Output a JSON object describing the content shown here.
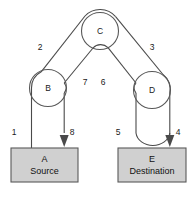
{
  "diagram": {
    "type": "pulley-system-schematic",
    "background_color": "#ffffff",
    "rope_color": "#4a4a4a",
    "block_fill_color": "#d0d0d0",
    "block_stroke_color": "#5a5a5a",
    "pulleys": [
      {
        "id": "C",
        "label": "C",
        "cx": 100,
        "cy": 31,
        "r": 18.5,
        "role": "top-fixed-pulley"
      },
      {
        "id": "B",
        "label": "B",
        "cx": 48,
        "cy": 88,
        "r": 18.5,
        "role": "left-pulley"
      },
      {
        "id": "D",
        "label": "D",
        "cx": 152,
        "cy": 90,
        "r": 18.5,
        "role": "right-pulley"
      }
    ],
    "blocks": [
      {
        "id": "A",
        "name": "A",
        "role": "Source",
        "x": 11,
        "y": 148,
        "width": 67,
        "height": 34
      },
      {
        "id": "E",
        "name": "E",
        "role": "Destination",
        "x": 118,
        "y": 148,
        "width": 68,
        "height": 34
      }
    ],
    "segment_labels": [
      {
        "label": "1",
        "x": 14,
        "y": 133,
        "segment": "A-up-to-B-left"
      },
      {
        "label": "2",
        "x": 40,
        "y": 48,
        "segment": "B-up-to-C-left"
      },
      {
        "label": "3",
        "x": 152,
        "y": 48,
        "segment": "C-right-down-to-D"
      },
      {
        "label": "4",
        "x": 178,
        "y": 133,
        "segment": "D-right-down-to-E"
      },
      {
        "label": "5",
        "x": 118,
        "y": 133,
        "segment": "E-up-to-D-left"
      },
      {
        "label": "6",
        "x": 103,
        "y": 83,
        "segment": "C-bottom-down-to-D"
      },
      {
        "label": "7",
        "x": 85,
        "y": 83,
        "segment": "C-bottom-down-to-B"
      },
      {
        "label": "8",
        "x": 72,
        "y": 133,
        "segment": "B-right-down-to-A"
      }
    ],
    "arrows": [
      {
        "label": "8",
        "tip_x": 64,
        "tip_y": 147,
        "direction": "down",
        "target": "A"
      },
      {
        "label": "4",
        "tip_x": 170,
        "tip_y": 147,
        "direction": "down",
        "target": "E"
      }
    ]
  }
}
